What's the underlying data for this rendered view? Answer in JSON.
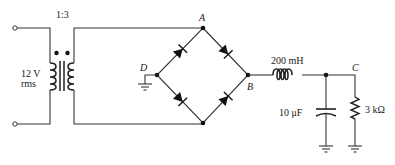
{
  "diagram": {
    "type": "circuit-schematic",
    "transformer": {
      "ratio_label": "1:3",
      "primary_voltage_label": "12 V",
      "primary_voltage_unit_label": "rms"
    },
    "nodes": {
      "A": "A",
      "B": "B",
      "C": "C",
      "D": "D"
    },
    "components": {
      "inductor_label": "200 mH",
      "capacitor_label": "10 μF",
      "resistor_label": "3 kΩ"
    },
    "bridge": {
      "diode_count": 4
    },
    "grounds": 3,
    "colors": {
      "wire": "#333333",
      "background": "#ffffff"
    }
  }
}
